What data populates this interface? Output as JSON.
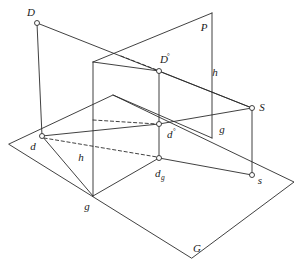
{
  "figure": {
    "background_color": "#ffffff",
    "line_color": "#2b2b2b",
    "vertex_fill": "#ffffff",
    "width": 302,
    "height": 273
  },
  "labels": {
    "D": "D",
    "P": "P",
    "D_image": "D",
    "D_image_sup": "°",
    "h_upper": "h",
    "S": "S",
    "d": "d",
    "d_image": "d",
    "d_image_sup": "°",
    "g_upper": "g",
    "h_lower": "h",
    "d_g": "d",
    "d_g_sub": "g",
    "s": "s",
    "g_lower": "g",
    "G": "G"
  },
  "points": {
    "D": {
      "x": 37,
      "y": 23,
      "label": "D",
      "label_x": 32,
      "label_y": 14
    },
    "P_corner": {
      "x": 212,
      "y": 13,
      "label": "P",
      "label_x": 203,
      "label_y": 30
    },
    "D_image": {
      "x": 159,
      "y": 71,
      "label": "D°",
      "label_x": 163,
      "label_y": 62
    },
    "h_upper": {
      "x": 213,
      "y": 75,
      "label": "h"
    },
    "S": {
      "x": 252,
      "y": 108,
      "label": "S",
      "label_x": 260,
      "label_y": 110
    },
    "d": {
      "x": 42,
      "y": 136,
      "label": "d",
      "label_x": 32,
      "label_y": 148
    },
    "d_image": {
      "x": 159,
      "y": 124,
      "label": "d°",
      "label_x": 166,
      "label_y": 137
    },
    "g_upper": {
      "x": 221,
      "y": 130,
      "label": "g"
    },
    "h_lower": {
      "x": 80,
      "y": 158,
      "label": "h"
    },
    "d_g": {
      "x": 159,
      "y": 158,
      "label": "dg",
      "label_x": 154,
      "label_y": 176
    },
    "s": {
      "x": 252,
      "y": 175,
      "label": "s",
      "label_x": 259,
      "label_y": 183
    },
    "g_lower": {
      "x": 86,
      "y": 207,
      "label": "g"
    },
    "G": {
      "x": 196,
      "y": 250,
      "label": "G"
    }
  },
  "ground_plane": {
    "name": "G",
    "corners": [
      {
        "x": 9,
        "y": 144
      },
      {
        "x": 113,
        "y": 95
      },
      {
        "x": 294,
        "y": 182
      },
      {
        "x": 192,
        "y": 258
      }
    ]
  },
  "picture_plane": {
    "name": "P",
    "corners": [
      {
        "x": 93,
        "y": 62
      },
      {
        "x": 212,
        "y": 13
      },
      {
        "x": 212,
        "y": 138
      },
      {
        "x": 93,
        "y": 196
      }
    ]
  },
  "vertical_plane_small": {
    "corners": [
      {
        "x": 93,
        "y": 62
      },
      {
        "x": 159,
        "y": 71
      },
      {
        "x": 159,
        "y": 158
      },
      {
        "x": 93,
        "y": 196
      }
    ]
  },
  "solid_edges": [
    {
      "name": "D-to-d-vertical",
      "from": {
        "x": 37,
        "y": 23
      },
      "to": {
        "x": 42,
        "y": 136
      }
    },
    {
      "name": "D-to-S-ray",
      "from": {
        "x": 37,
        "y": 23
      },
      "to": {
        "x": 252,
        "y": 108
      }
    },
    {
      "name": "picture-plane-top",
      "from": {
        "x": 93,
        "y": 62
      },
      "to": {
        "x": 212,
        "y": 13
      }
    },
    {
      "name": "picture-plane-right",
      "from": {
        "x": 212,
        "y": 13
      },
      "to": {
        "x": 212,
        "y": 138
      }
    },
    {
      "name": "vertical-plane-left",
      "from": {
        "x": 93,
        "y": 62
      },
      "to": {
        "x": 93,
        "y": 196
      }
    },
    {
      "name": "vertical-plane-top",
      "from": {
        "x": 93,
        "y": 62
      },
      "to": {
        "x": 159,
        "y": 71
      }
    },
    {
      "name": "Dimage-vertical",
      "from": {
        "x": 159,
        "y": 71
      },
      "to": {
        "x": 159,
        "y": 158
      }
    },
    {
      "name": "Dimage-to-S",
      "from": {
        "x": 159,
        "y": 71
      },
      "to": {
        "x": 252,
        "y": 108
      }
    },
    {
      "name": "d-to-dimage",
      "from": {
        "x": 42,
        "y": 136
      },
      "to": {
        "x": 159,
        "y": 124
      }
    },
    {
      "name": "dimage-to-S",
      "from": {
        "x": 159,
        "y": 124
      },
      "to": {
        "x": 252,
        "y": 108
      }
    },
    {
      "name": "d-to-dg",
      "from": {
        "x": 42,
        "y": 136
      },
      "to": {
        "x": 159,
        "y": 158
      }
    },
    {
      "name": "dg-to-s",
      "from": {
        "x": 159,
        "y": 158
      },
      "to": {
        "x": 252,
        "y": 175
      }
    },
    {
      "name": "S-to-s-vertical",
      "from": {
        "x": 252,
        "y": 108
      },
      "to": {
        "x": 252,
        "y": 175
      }
    },
    {
      "name": "dg-to-g-lower",
      "from": {
        "x": 159,
        "y": 158
      },
      "to": {
        "x": 93,
        "y": 196
      }
    },
    {
      "name": "ground-left-edge",
      "from": {
        "x": 9,
        "y": 144
      },
      "to": {
        "x": 113,
        "y": 95
      }
    },
    {
      "name": "ground-top-edge",
      "from": {
        "x": 113,
        "y": 95
      },
      "to": {
        "x": 294,
        "y": 182
      }
    },
    {
      "name": "ground-right-edge",
      "from": {
        "x": 294,
        "y": 182
      },
      "to": {
        "x": 192,
        "y": 258
      }
    },
    {
      "name": "ground-bottom-edge",
      "from": {
        "x": 192,
        "y": 258
      },
      "to": {
        "x": 9,
        "y": 144
      }
    },
    {
      "name": "horizon-through-P",
      "from": {
        "x": 212,
        "y": 138
      },
      "to": {
        "x": 113,
        "y": 95
      }
    }
  ],
  "dashed_edges": [
    {
      "name": "D-to-Dimage-dashed",
      "from": {
        "x": 120,
        "y": 56
      },
      "to": {
        "x": 159,
        "y": 71
      }
    },
    {
      "name": "d-to-dg-dashed",
      "from": {
        "x": 42,
        "y": 136
      },
      "to": {
        "x": 159,
        "y": 158
      }
    },
    {
      "name": "dimage-dashed-left",
      "from": {
        "x": 93,
        "y": 119
      },
      "to": {
        "x": 159,
        "y": 124
      }
    }
  ]
}
